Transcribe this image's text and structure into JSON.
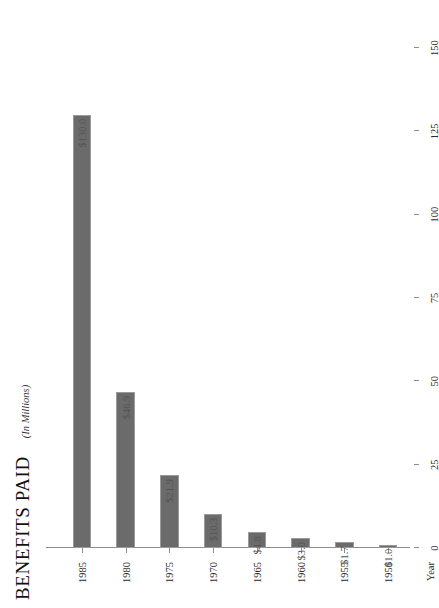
{
  "chart_data": {
    "type": "bar",
    "orientation": "horizontal",
    "title": "BENEFITS PAID",
    "subtitle": "(In Millions)",
    "xlabel": "",
    "ylabel": "Year",
    "categories": [
      "1950",
      "1955",
      "1960",
      "1965",
      "1970",
      "1975",
      "1980",
      "1985"
    ],
    "values": [
      1.0,
      1.7,
      3.0,
      4.8,
      10.3,
      21.9,
      46.9,
      130.0
    ],
    "data_labels": [
      "$1.0",
      "$1.7",
      "$3.0",
      "$4.8",
      "$10.3",
      "$21.9",
      "$46.9",
      "$130.0"
    ],
    "xlim": [
      0,
      150
    ],
    "xticks": [
      0,
      25,
      50,
      75,
      100,
      125,
      150
    ],
    "xtick_labels": [
      "0",
      "25",
      "50",
      "75",
      "100",
      "125",
      "150"
    ],
    "grid": false,
    "legend": false,
    "bar_color": "#6b6b6b",
    "bar_border_color": "#9a9a9a",
    "axis_color": "#8c8c8c",
    "label_color": "#555555",
    "rotation_degrees": -90
  }
}
